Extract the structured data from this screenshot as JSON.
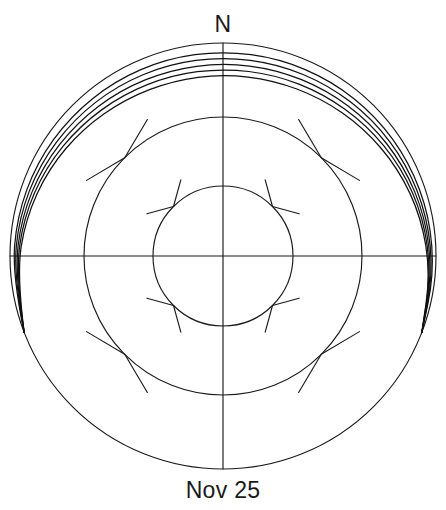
{
  "labels": {
    "north": "N",
    "date": "Nov 25"
  },
  "colors": {
    "line": "#1a1a1a",
    "arc": "#111111",
    "background": "#ffffff"
  },
  "chart_data": {
    "type": "line",
    "title": "Nov 25",
    "projection": "polar-stereographic-sun-path",
    "xlabel": "",
    "ylabel": "",
    "center": {
      "x": 223,
      "y": 256
    },
    "grid": {
      "grid_on": true,
      "circles": [
        {
          "name": "horizon",
          "radius": 213,
          "altitude_deg": 0
        },
        {
          "name": "altitude-30",
          "radius": 139,
          "altitude_deg": 30
        },
        {
          "name": "altitude-60",
          "radius": 70,
          "altitude_deg": 60
        }
      ],
      "axes": [
        {
          "name": "meridian-north-south",
          "azimuth_deg": 0,
          "label": "N"
        },
        {
          "name": "prime-vertical-east-west",
          "azimuth_deg": 90,
          "label": ""
        }
      ],
      "tick_azimuths_deg": [
        45,
        135,
        225,
        315
      ],
      "tick_circles": [
        "altitude-30",
        "altitude-60"
      ],
      "tick_length": 17
    },
    "axis_ranges": {
      "azimuth": [
        0,
        360
      ],
      "altitude": [
        0,
        90
      ]
    },
    "legend_position": "none",
    "series": [
      {
        "name": "path-1",
        "rise_azimuth_deg": 249.0,
        "set_azimuth_deg": 111.0,
        "peak_altitude_deg": 12.6,
        "values": [
          0,
          2.4,
          4.9,
          7.3,
          9.6,
          11.4,
          12.4,
          12.6,
          12.2,
          11.0,
          9.2,
          6.9,
          4.4,
          2.0,
          0
        ]
      },
      {
        "name": "path-2",
        "rise_azimuth_deg": 249.0,
        "set_azimuth_deg": 111.0,
        "peak_altitude_deg": 10.3,
        "values": [
          0,
          2.0,
          4.0,
          6.0,
          7.9,
          9.3,
          10.1,
          10.3,
          9.9,
          9.0,
          7.5,
          5.6,
          3.6,
          1.7,
          0
        ]
      },
      {
        "name": "path-3",
        "rise_azimuth_deg": 249.0,
        "set_azimuth_deg": 111.0,
        "peak_altitude_deg": 8.0,
        "values": [
          0,
          1.6,
          3.1,
          4.7,
          6.1,
          7.2,
          7.9,
          8.0,
          7.7,
          7.0,
          5.8,
          4.4,
          2.8,
          1.3,
          0
        ]
      },
      {
        "name": "path-4",
        "rise_azimuth_deg": 249.0,
        "set_azimuth_deg": 111.0,
        "peak_altitude_deg": 5.6,
        "values": [
          0,
          1.1,
          2.2,
          3.3,
          4.3,
          5.0,
          5.5,
          5.6,
          5.4,
          4.9,
          4.1,
          3.1,
          2.0,
          0.9,
          0
        ]
      },
      {
        "name": "path-5",
        "rise_azimuth_deg": 249.0,
        "set_azimuth_deg": 111.0,
        "peak_altitude_deg": 3.2,
        "values": [
          0,
          0.6,
          1.3,
          1.9,
          2.5,
          2.9,
          3.1,
          3.2,
          3.1,
          2.8,
          2.3,
          1.8,
          1.1,
          0.5,
          0
        ]
      }
    ]
  }
}
